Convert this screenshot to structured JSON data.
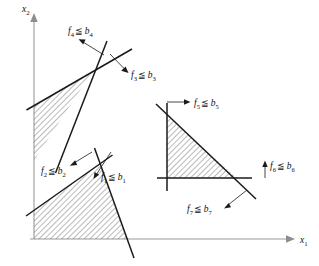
{
  "figure": {
    "background_color": "#ffffff",
    "line_color": "#1a1a1a",
    "axis_color": "#9a9a9a",
    "hatch_color": "#555555",
    "axes": {
      "y_axis": {
        "name": "x2",
        "label_var": "x",
        "label_sub": "2"
      },
      "x_axis": {
        "name": "x1",
        "label_var": "x",
        "label_sub": "1"
      }
    },
    "constraints": [
      {
        "id": "f1",
        "var": "f",
        "sub": "1",
        "rel": "≦",
        "bound_var": "b",
        "bound_sub": "1",
        "label_x": 96,
        "label_y": 180
      },
      {
        "id": "f2",
        "var": "f",
        "sub": "2",
        "rel": "≦",
        "bound_var": "b",
        "bound_sub": "2",
        "label_x": 41,
        "label_y": 170
      },
      {
        "id": "f3",
        "var": "f",
        "sub": "3",
        "rel": "≦",
        "bound_var": "b",
        "bound_sub": "3",
        "label_x": 124,
        "label_y": 70
      },
      {
        "id": "f4",
        "var": "f",
        "sub": "4",
        "rel": "≦",
        "bound_var": "b",
        "bound_sub": "4",
        "label_x": 68,
        "label_y": 34
      },
      {
        "id": "f5",
        "var": "f",
        "sub": "5",
        "rel": "≦",
        "bound_var": "b",
        "bound_sub": "5",
        "label_x": 191,
        "label_y": 106
      },
      {
        "id": "f6",
        "var": "f",
        "sub": "6",
        "rel": "≦",
        "bound_var": "b",
        "bound_sub": "6",
        "label_x": 270,
        "label_y": 170
      },
      {
        "id": "f7",
        "var": "f",
        "sub": "7",
        "rel": "≦",
        "bound_var": "b",
        "bound_sub": "7",
        "label_x": 190,
        "label_y": 208
      }
    ],
    "regions": [
      {
        "name": "upper-left-wedge",
        "shaded": true
      },
      {
        "name": "lower-left-polygon",
        "shaded": true
      },
      {
        "name": "right-triangle",
        "shaded": true
      }
    ]
  }
}
